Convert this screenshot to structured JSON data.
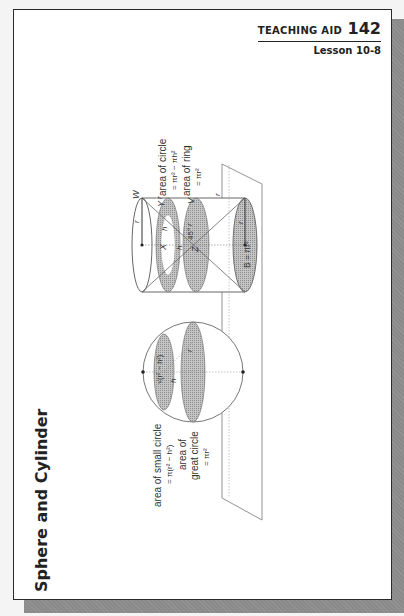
{
  "header": {
    "aid_label": "TEACHING AID",
    "aid_number": "142",
    "lesson": "Lesson 10-8"
  },
  "title": "Sphere and Cylinder",
  "diagram": {
    "cylinder_labels": {
      "area_of_circle": "area of circle",
      "area_of_circle_formula": "= πr² − πh²",
      "area_of_ring": "area of ring",
      "area_of_ring_formula": "= πr²",
      "base_formula": "B = πr²",
      "points": [
        "W",
        "Y",
        "V",
        "X",
        "Z"
      ],
      "angle": "45°",
      "r": "r",
      "h": "h"
    },
    "sphere_labels": {
      "area_small_circle": "area of small circle",
      "area_small_circle_formula": "= π(r² − h²)",
      "area_great_circle_1": "area of",
      "area_great_circle_2": "great circle",
      "area_great_circle_formula": "= πr²",
      "radius_expr": "√(r² − h²)",
      "r": "r",
      "h": "h"
    }
  },
  "colors": {
    "shade": "#b4b4b4",
    "line": "#555555",
    "border": "#2a2a2a",
    "shadow": "#8a8a8a"
  }
}
